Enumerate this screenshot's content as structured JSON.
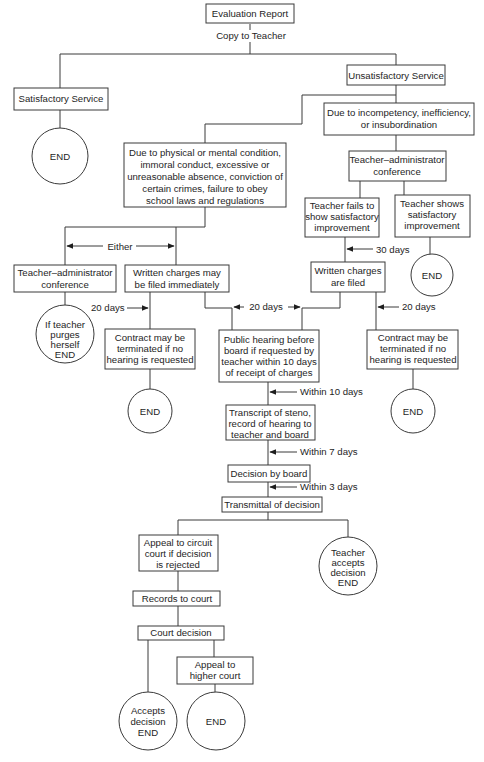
{
  "diagram": {
    "type": "flowchart",
    "title": "Evaluation Report",
    "nodes": {
      "evaluation_report": "Evaluation Report",
      "satisfactory_service": "Satisfactory Service",
      "unsatisfactory_service": "Unsatisfactory Service",
      "end_satisfactory": "END",
      "due_incompetency": [
        "Due to incompetency, inefficiency,",
        "or insubordination"
      ],
      "due_physical": [
        "Due to physical or mental condition,",
        "immoral conduct, excessive or",
        "unreasonable absence, conviction of",
        "certain crimes, failure to obey",
        "school laws and regulations"
      ],
      "conference_right": [
        "Teacher–administrator",
        "conference"
      ],
      "teacher_fails": [
        "Teacher fails to",
        "show satisfactory",
        "improvement"
      ],
      "teacher_shows": [
        "Teacher shows",
        "satisfactory",
        "improvement"
      ],
      "end_improvement": "END",
      "conference_left": [
        "Teacher–administrator",
        "conference"
      ],
      "charges_immediately": [
        "Written charges may",
        "be filed immediately"
      ],
      "charges_filed": [
        "Written charges",
        "are filed"
      ],
      "purges_end": [
        "If teacher",
        "purges",
        "herself",
        "END"
      ],
      "contract_left": [
        "Contract may be",
        "terminated if no",
        "hearing is requested"
      ],
      "public_hearing": [
        "Public hearing before",
        "board if requested by",
        "teacher within 10 days",
        "of receipt of charges"
      ],
      "contract_right": [
        "Contract may be",
        "terminated if no",
        "hearing is requested"
      ],
      "end_contract_left": "END",
      "end_contract_right": "END",
      "transcript": [
        "Transcript of steno,",
        "record of hearing to",
        "teacher and board"
      ],
      "decision_board": "Decision by board",
      "transmittal": "Transmittal of decision",
      "appeal_circuit": [
        "Appeal to circuit",
        "court if decision",
        "is rejected"
      ],
      "teacher_accepts": [
        "Teacher",
        "accepts",
        "decision",
        "END"
      ],
      "records_court": "Records to court",
      "court_decision": "Court decision",
      "appeal_higher": [
        "Appeal to",
        "higher court"
      ],
      "accepts_decision": [
        "Accepts",
        "decision",
        "END"
      ],
      "end_final": "END"
    },
    "edge_labels": {
      "copy_to_teacher": "Copy to Teacher",
      "either": "Either",
      "thirty_days": "30 days",
      "twenty_days_left": "20 days",
      "twenty_days_mid": "20 days",
      "twenty_days_right": "20 days",
      "within_10_days": "Within 10 days",
      "within_7_days": "Within 7 days",
      "within_3_days": "Within 3 days"
    },
    "colors": {
      "line": "#3a3a3a",
      "text": "#1e1e1e",
      "background": "#ffffff"
    }
  }
}
